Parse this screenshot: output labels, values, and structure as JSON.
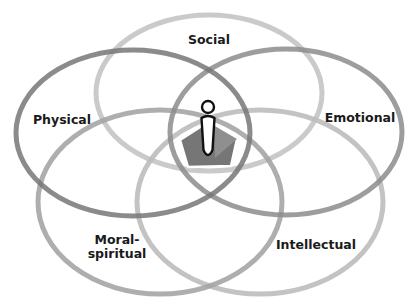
{
  "diagram": {
    "type": "venn",
    "center_figure": "person-icon",
    "rings": [
      {
        "id": "social",
        "label": "Social",
        "color": "#c4c4c4",
        "cx": 209,
        "cy": 93,
        "rx": 113,
        "ry": 78,
        "label_x": 209,
        "label_y": 42
      },
      {
        "id": "physical",
        "label": "Physical",
        "color": "#777777",
        "cx": 133,
        "cy": 133,
        "rx": 117,
        "ry": 83,
        "label_x": 64,
        "label_y": 122
      },
      {
        "id": "emotional",
        "label": "Emotional",
        "color": "#8c8c8c",
        "cx": 286,
        "cy": 132,
        "rx": 116,
        "ry": 83,
        "label_x": 359,
        "label_y": 122
      },
      {
        "id": "moral-spiritual",
        "label_line1": "Moral-",
        "label_line2": "spiritual",
        "color": "#a3a3a3",
        "cx": 160,
        "cy": 202,
        "rx": 122,
        "ry": 92,
        "label_x": 117,
        "label_y": 243
      },
      {
        "id": "intellectual",
        "label": "Intellectual",
        "color": "#bdbdbd",
        "cx": 260,
        "cy": 202,
        "rx": 123,
        "ry": 92,
        "label_x": 316,
        "label_y": 247
      }
    ],
    "pentagon": {
      "fill": "#767676",
      "highlight": "#8f8f8f",
      "stroke": "#ffffff"
    }
  },
  "labels": {
    "social": "Social",
    "physical": "Physical",
    "emotional": "Emotional",
    "moral_line1": "Moral-",
    "moral_line2": "spiritual",
    "intellectual": "Intellectual"
  }
}
